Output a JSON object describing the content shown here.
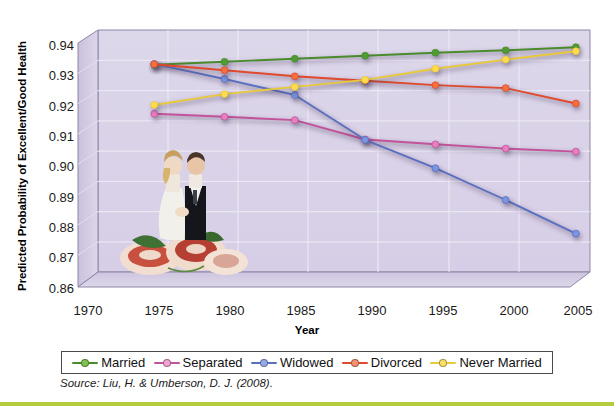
{
  "chart_data": {
    "type": "line",
    "title": "",
    "xlabel": "Year",
    "ylabel": "Predicted Probability of Excellent/Good Health",
    "xlim": [
      1970,
      2005
    ],
    "ylim": [
      0.86,
      0.94
    ],
    "xticks": [
      "1970",
      "1975",
      "1980",
      "1985",
      "1990",
      "1995",
      "2000",
      "2005"
    ],
    "yticks": [
      "0.94",
      "0.93",
      "0.92",
      "0.91",
      "0.90",
      "0.89",
      "0.88",
      "0.87",
      "0.86"
    ],
    "grid": true,
    "legend_position": "bottom",
    "x": [
      1974,
      1979,
      1984,
      1989,
      1994,
      1999,
      2004
    ],
    "series": [
      {
        "name": "Married",
        "color": "#4a8b2c",
        "marker_color": "#4f9c33",
        "values": [
          0.9285,
          0.9295,
          0.9305,
          0.9315,
          0.9325,
          0.9333,
          0.9343
        ]
      },
      {
        "name": "Separated",
        "color": "#c2529a",
        "marker_color": "#e87fc0",
        "values": [
          0.9123,
          0.9113,
          0.9102,
          0.9038,
          0.9022,
          0.9008,
          0.8998
        ]
      },
      {
        "name": "Widowed",
        "color": "#5b6fc0",
        "marker_color": "#7b95e0",
        "values": [
          0.9288,
          0.9238,
          0.9185,
          0.9037,
          0.8943,
          0.8838,
          0.8727
        ]
      },
      {
        "name": "Divorced",
        "color": "#e0492c",
        "marker_color": "#f4703f",
        "values": [
          0.9287,
          0.9267,
          0.9247,
          0.9232,
          0.9218,
          0.9208,
          0.9157
        ]
      },
      {
        "name": "Never Married",
        "color": "#e8c93a",
        "marker_color": "#ffdb4d",
        "values": [
          0.9152,
          0.9188,
          0.9212,
          0.9235,
          0.9272,
          0.9302,
          0.933
        ]
      }
    ],
    "source": "Source: Liu, H. & Umberson, D. J. (2008)."
  },
  "legend": {
    "items": [
      {
        "label": "Married"
      },
      {
        "label": "Separated"
      },
      {
        "label": "Widowed"
      },
      {
        "label": "Divorced"
      },
      {
        "label": "Never Married"
      }
    ]
  },
  "decor": {
    "accent_bar_color": "#b5cc3f",
    "plot_face_color": "#d9d2e6",
    "wall_color": "#cdc4e0"
  }
}
